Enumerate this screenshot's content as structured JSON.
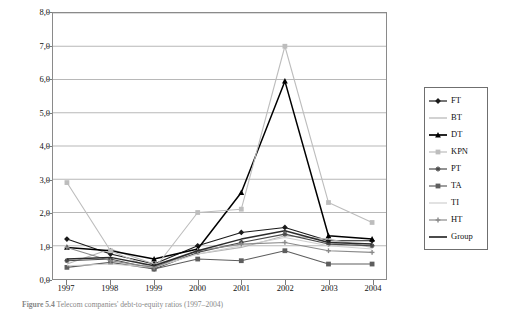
{
  "figure": {
    "caption_label": "Figure 5.4",
    "caption_text": "Telecom companies' debt-to-equity ratios (1997–2004)"
  },
  "chart_data": {
    "type": "line",
    "title": "",
    "xlabel": "",
    "ylabel": "Debt (BV)/Equity (MV)",
    "x": [
      "1997",
      "1998",
      "1999",
      "2000",
      "2001",
      "2002",
      "2003",
      "2004"
    ],
    "xtick_labels": [
      "1997",
      "1998",
      "1999",
      "2000",
      "2001",
      "2002",
      "2003",
      "2004"
    ],
    "ytick_labels": [
      "0,0",
      "1,0",
      "2,0",
      "3,0",
      "4,0",
      "5,0",
      "6,0",
      "7,0",
      "8,0"
    ],
    "ytick_values": [
      0,
      1,
      2,
      3,
      4,
      5,
      6,
      7,
      8
    ],
    "ylim": [
      0,
      8
    ],
    "grid": "horizontal",
    "legend_position": "right-outside",
    "decimal_separator": ",",
    "series": [
      {
        "name": "FT",
        "color": "#1a1a1a",
        "marker": "diamond",
        "values": [
          1.2,
          0.75,
          0.45,
          1.0,
          1.4,
          1.55,
          1.15,
          1.15
        ]
      },
      {
        "name": "BT",
        "color": "#b4b4b4",
        "marker": "line",
        "values": [
          0.45,
          0.9,
          0.45,
          0.75,
          0.95,
          1.3,
          1.2,
          0.95
        ]
      },
      {
        "name": "DT",
        "color": "#000000",
        "marker": "triangle",
        "values": [
          0.95,
          0.85,
          0.6,
          0.9,
          2.6,
          5.95,
          1.3,
          1.2
        ]
      },
      {
        "name": "KPN",
        "color": "#bdbdbd",
        "marker": "square",
        "values": [
          2.9,
          0.85,
          0.3,
          2.0,
          2.1,
          7.0,
          2.3,
          1.7
        ]
      },
      {
        "name": "PT",
        "color": "#4a4a4a",
        "marker": "star",
        "values": [
          0.55,
          0.6,
          0.3,
          0.8,
          1.1,
          1.35,
          1.05,
          1.0
        ]
      },
      {
        "name": "TA",
        "color": "#5e5e5e",
        "marker": "square",
        "values": [
          0.35,
          0.5,
          0.3,
          0.6,
          0.55,
          0.85,
          0.45,
          0.45
        ]
      },
      {
        "name": "TI",
        "color": "#cfcfcf",
        "marker": "line",
        "values": [
          0.4,
          0.45,
          0.35,
          0.75,
          1.0,
          1.25,
          1.0,
          0.9
        ]
      },
      {
        "name": "HT",
        "color": "#8a8a8a",
        "marker": "plus",
        "values": [
          0.95,
          0.55,
          0.35,
          0.85,
          1.05,
          1.1,
          0.85,
          0.8
        ]
      },
      {
        "name": "Group",
        "color": "#2b2b2b",
        "marker": "none",
        "values": [
          0.6,
          0.65,
          0.4,
          0.85,
          1.2,
          1.45,
          1.1,
          1.05
        ]
      }
    ]
  }
}
